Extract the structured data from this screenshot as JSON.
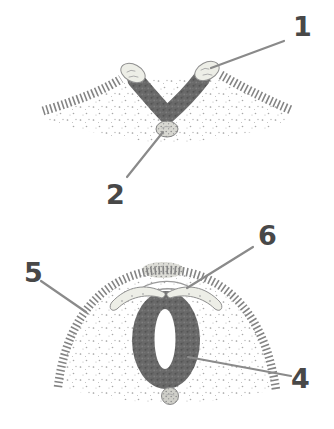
{
  "figure": {
    "labels": {
      "l1": "1",
      "l2": "2",
      "l4": "4",
      "l5": "5",
      "l6": "6"
    },
    "colors": {
      "background": "#ffffff",
      "numeral_ink": "#484848",
      "leader_line": "#8a8a8a",
      "dark_tissue": "#646464",
      "light_tissue": "#edeee7",
      "stipple_dot": "#a0a0a0",
      "ectoderm_stripe": "#848484",
      "outline": "#8f8f8f"
    }
  }
}
